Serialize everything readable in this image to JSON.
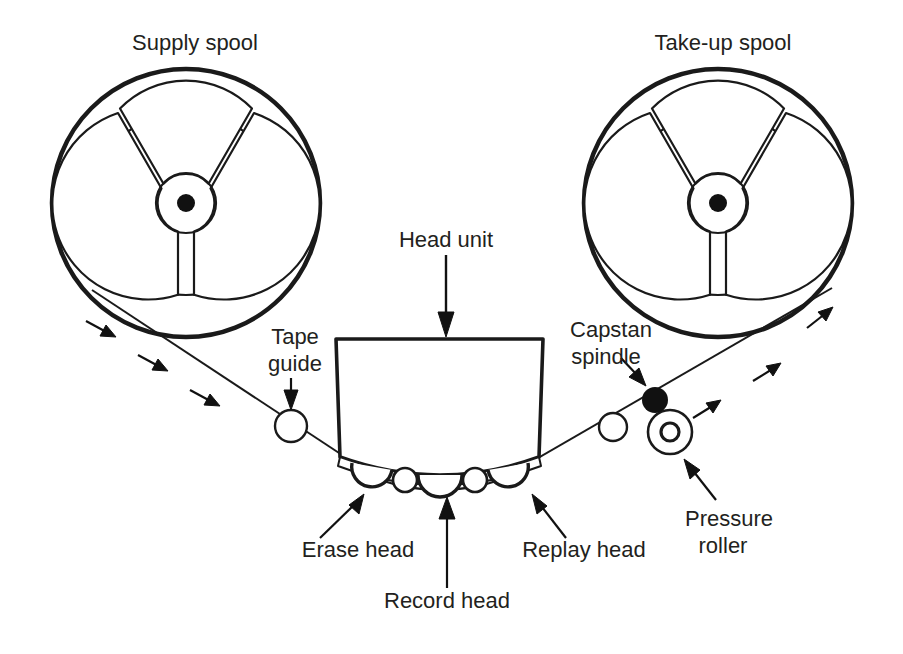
{
  "diagram": {
    "background_color": "#ffffff",
    "line_color": "#1a1a1a",
    "text_color": "#231f20",
    "labels": {
      "supply_spool": "Supply spool",
      "take_up_spool": "Take-up spool",
      "head_unit": "Head unit",
      "tape_guide_line1": "Tape",
      "tape_guide_line2": "guide",
      "capstan_line1": "Capstan",
      "capstan_line2": "spindle",
      "pressure_roller_line1": "Pressure",
      "pressure_roller_line2": "roller",
      "erase_head": "Erase head",
      "record_head": "Record head",
      "replay_head": "Replay head"
    },
    "components": [
      {
        "name": "supply-spool",
        "label": "Supply spool",
        "shape": "three-spoke-reel",
        "cx": 186,
        "cy": 203,
        "r_outer": 134,
        "r_inner": 92,
        "r_hub": 30,
        "r_center_dot": 9
      },
      {
        "name": "take-up-spool",
        "label": "Take-up spool",
        "shape": "three-spoke-reel",
        "cx": 718,
        "cy": 203,
        "r_outer": 134,
        "r_inner": 92,
        "r_hub": 30,
        "r_center_dot": 9
      },
      {
        "name": "head-unit",
        "label": "Head unit",
        "shape": "box-with-curved-base",
        "x": 336,
        "y": 339,
        "w": 207,
        "h": 118
      },
      {
        "name": "tape-guide-left",
        "label": "Tape guide",
        "shape": "circle",
        "cx": 291,
        "cy": 426,
        "r": 16
      },
      {
        "name": "tape-guide-right",
        "label": "",
        "shape": "circle",
        "cx": 613,
        "cy": 427,
        "r": 14
      },
      {
        "name": "capstan-spindle",
        "label": "Capstan spindle",
        "shape": "filled-circle",
        "cx": 655,
        "cy": 400,
        "r": 13
      },
      {
        "name": "pressure-roller",
        "label": "Pressure roller",
        "shape": "concentric-circles",
        "cx": 670,
        "cy": 432,
        "r_outer": 22,
        "r_inner": 9
      },
      {
        "name": "erase-head",
        "label": "Erase head",
        "shape": "semicircle-bump"
      },
      {
        "name": "record-head",
        "label": "Record head",
        "shape": "semicircle-bump"
      },
      {
        "name": "replay-head",
        "label": "Replay head",
        "shape": "semicircle-bump"
      }
    ],
    "tape_direction": {
      "left_side": "down-right",
      "right_side": "up-right",
      "arrow_count_left": 3,
      "arrow_count_right": 3
    }
  }
}
